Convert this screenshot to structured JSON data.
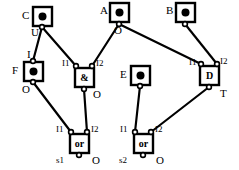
{
  "diagram": {
    "stroke_color": "#000000",
    "fill_color": "#ffffff",
    "background": "#ffffff"
  },
  "blocks": [
    {
      "id": "C",
      "name": "block-c",
      "kind": "dot-block",
      "label": "C",
      "label_x": 22,
      "label_y": 10,
      "x": 33,
      "y": 7,
      "w": 19,
      "h": 19,
      "port_labels": [
        {
          "text": "U",
          "x": 31,
          "y": 27
        }
      ]
    },
    {
      "id": "A",
      "name": "block-a",
      "kind": "dot-block",
      "label": "A",
      "label_x": 100,
      "label_y": 5,
      "x": 110,
      "y": 3,
      "w": 19,
      "h": 19,
      "port_labels": [
        {
          "text": "O",
          "x": 114,
          "y": 25
        }
      ]
    },
    {
      "id": "B",
      "name": "block-b",
      "kind": "dot-block",
      "label": "B",
      "label_x": 166,
      "label_y": 5,
      "x": 176,
      "y": 3,
      "w": 19,
      "h": 19,
      "port_labels": []
    },
    {
      "id": "F",
      "name": "block-f",
      "kind": "dot-block",
      "label": "F",
      "label_x": 12,
      "label_y": 65,
      "x": 24,
      "y": 62,
      "w": 19,
      "h": 19,
      "port_labels": [
        {
          "text": "I",
          "x": 27,
          "y": 49
        },
        {
          "text": "O",
          "x": 22,
          "y": 84
        }
      ]
    },
    {
      "id": "E",
      "name": "block-e",
      "kind": "dot-block",
      "label": "E",
      "label_x": 120,
      "label_y": 69,
      "x": 131,
      "y": 66,
      "w": 19,
      "h": 19,
      "port_labels": []
    },
    {
      "id": "D",
      "name": "block-d",
      "kind": "text-block",
      "label": "D",
      "inner_text": "D",
      "x": 200,
      "y": 66,
      "w": 19,
      "h": 19,
      "port_labels": [
        {
          "text": "I1",
          "x": 189,
          "y": 58
        },
        {
          "text": "I2",
          "x": 220,
          "y": 57
        },
        {
          "text": "T",
          "x": 220,
          "y": 88
        }
      ]
    },
    {
      "id": "AND1",
      "name": "gate-and",
      "kind": "gate",
      "inner_text": "&",
      "x": 75,
      "y": 68,
      "w": 19,
      "h": 19,
      "port_labels": [
        {
          "text": "I1",
          "x": 62,
          "y": 59
        },
        {
          "text": "I2",
          "x": 96,
          "y": 59
        },
        {
          "text": "O",
          "x": 93,
          "y": 89
        }
      ]
    },
    {
      "id": "OR1",
      "name": "gate-or-s1",
      "kind": "gate",
      "inner_text": "or",
      "x": 70,
      "y": 134,
      "w": 19,
      "h": 19,
      "port_labels": [
        {
          "text": "I1",
          "x": 56,
          "y": 125
        },
        {
          "text": "I2",
          "x": 91,
          "y": 125
        },
        {
          "text": "s1",
          "x": 56,
          "y": 156
        },
        {
          "text": "O",
          "x": 92,
          "y": 155
        }
      ]
    },
    {
      "id": "OR2",
      "name": "gate-or-s2",
      "kind": "gate",
      "inner_text": "or",
      "x": 134,
      "y": 134,
      "w": 19,
      "h": 19,
      "port_labels": [
        {
          "text": "I1",
          "x": 120,
          "y": 125
        },
        {
          "text": "I2",
          "x": 155,
          "y": 125
        },
        {
          "text": "s2",
          "x": 119,
          "y": 156
        },
        {
          "text": "O",
          "x": 156,
          "y": 155
        }
      ]
    }
  ],
  "pins": [
    {
      "name": "pin-c-u",
      "x": 42,
      "y": 27
    },
    {
      "name": "pin-a-o",
      "x": 119,
      "y": 24
    },
    {
      "name": "pin-b-o",
      "x": 185,
      "y": 24
    },
    {
      "name": "pin-f-i",
      "x": 33,
      "y": 61
    },
    {
      "name": "pin-f-o",
      "x": 33,
      "y": 82
    },
    {
      "name": "pin-e-o",
      "x": 140,
      "y": 86
    },
    {
      "name": "pin-and-i1",
      "x": 76,
      "y": 66
    },
    {
      "name": "pin-and-i2",
      "x": 92,
      "y": 66
    },
    {
      "name": "pin-and-o",
      "x": 84,
      "y": 89
    },
    {
      "name": "pin-d-i1",
      "x": 201,
      "y": 64
    },
    {
      "name": "pin-d-i2",
      "x": 217,
      "y": 64
    },
    {
      "name": "pin-d-t",
      "x": 209,
      "y": 87
    },
    {
      "name": "pin-or1-i1",
      "x": 71,
      "y": 132
    },
    {
      "name": "pin-or1-i2",
      "x": 87,
      "y": 132
    },
    {
      "name": "pin-or1-o",
      "x": 79,
      "y": 155
    },
    {
      "name": "pin-or2-i1",
      "x": 135,
      "y": 132
    },
    {
      "name": "pin-or2-i2",
      "x": 151,
      "y": 132
    },
    {
      "name": "pin-or2-o",
      "x": 143,
      "y": 155
    }
  ],
  "wires": [
    {
      "name": "wire-c-to-f",
      "from": "pin-c-u",
      "x1": 42,
      "y1": 27,
      "x2": 33,
      "y2": 61
    },
    {
      "name": "wire-c-to-and",
      "from": "pin-c-u",
      "x1": 42,
      "y1": 27,
      "x2": 76,
      "y2": 66
    },
    {
      "name": "wire-a-to-and",
      "from": "pin-a-o",
      "x1": 119,
      "y1": 24,
      "x2": 92,
      "y2": 66
    },
    {
      "name": "wire-a-to-d",
      "from": "pin-a-o",
      "x1": 119,
      "y1": 24,
      "x2": 201,
      "y2": 64
    },
    {
      "name": "wire-b-to-d",
      "from": "pin-b-o",
      "x1": 185,
      "y1": 24,
      "x2": 217,
      "y2": 64
    },
    {
      "name": "wire-f-to-or1",
      "from": "pin-f-o",
      "x1": 33,
      "y1": 82,
      "x2": 71,
      "y2": 132
    },
    {
      "name": "wire-and-to-or1",
      "from": "pin-and-o",
      "x1": 84,
      "y1": 89,
      "x2": 87,
      "y2": 132
    },
    {
      "name": "wire-e-to-or2",
      "from": "pin-e-o",
      "x1": 140,
      "y1": 86,
      "x2": 135,
      "y2": 132
    },
    {
      "name": "wire-d-to-or2",
      "from": "pin-d-t",
      "x1": 209,
      "y1": 87,
      "x2": 151,
      "y2": 132
    }
  ]
}
